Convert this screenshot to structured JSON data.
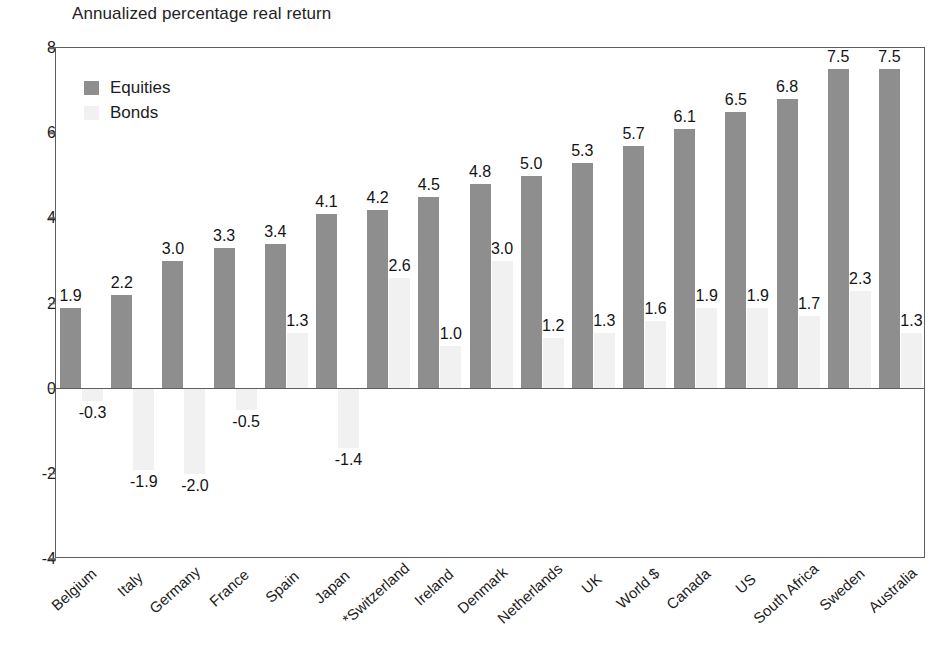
{
  "chart_data": {
    "type": "bar",
    "title": "Annualized percentage real return",
    "xlabel": "",
    "ylabel": "",
    "ylim": [
      -4,
      8
    ],
    "yticks": [
      "8",
      "6",
      "4",
      "2",
      "0",
      "-2",
      "-4"
    ],
    "ytick_values": [
      8,
      6,
      4,
      2,
      0,
      -2,
      -4
    ],
    "grid": false,
    "legend_position": "top-left-inside",
    "categories": [
      "Belgium",
      "Italy",
      "Germany",
      "France",
      "Spain",
      "Japan",
      "*Switzerland",
      "Ireland",
      "Denmark",
      "Netherlands",
      "UK",
      "World $",
      "Canada",
      "US",
      "South Africa",
      "Sweden",
      "Australia"
    ],
    "series": [
      {
        "name": "Equities",
        "color": "#8e8e8e",
        "values": [
          1.9,
          2.2,
          3.0,
          3.3,
          3.4,
          4.1,
          4.2,
          4.5,
          4.8,
          5.0,
          5.3,
          5.7,
          6.1,
          6.5,
          6.8,
          7.5,
          7.5
        ],
        "labels": [
          "1.9",
          "2.2",
          "3.0",
          "3.3",
          "3.4",
          "4.1",
          "4.2",
          "4.5",
          "4.8",
          "5.0",
          "5.3",
          "5.7",
          "6.1",
          "6.5",
          "6.8",
          "7.5",
          "7.5"
        ]
      },
      {
        "name": "Bonds",
        "color": "#f1f1f1",
        "values": [
          -0.3,
          -1.9,
          -2.0,
          -0.5,
          1.3,
          -1.4,
          2.6,
          1.0,
          3.0,
          1.2,
          1.3,
          1.6,
          1.9,
          1.9,
          1.7,
          2.3,
          1.3
        ],
        "labels": [
          "-0.3",
          "-1.9",
          "-2.0",
          "-0.5",
          "1.3",
          "-1.4",
          "2.6",
          "1.0",
          "3.0",
          "1.2",
          "1.3",
          "1.6",
          "1.9",
          "1.9",
          "1.7",
          "2.3",
          "1.3"
        ]
      }
    ]
  },
  "legend": {
    "items": [
      {
        "label": "Equities",
        "swatch": "equities"
      },
      {
        "label": "Bonds",
        "swatch": "bonds"
      }
    ]
  }
}
